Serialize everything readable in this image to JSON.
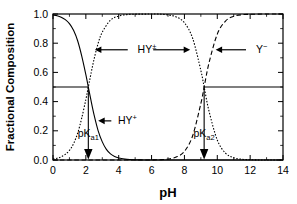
{
  "chart_data": {
    "type": "line",
    "title": "",
    "xlabel": "pH",
    "ylabel": "Fractional Composition",
    "xlim": [
      0,
      14
    ],
    "ylim": [
      0.0,
      1.0
    ],
    "xticks": [
      0,
      2,
      4,
      6,
      8,
      10,
      12,
      14
    ],
    "xtick_labels": [
      "0",
      "2",
      "4",
      "6",
      "8",
      "10",
      "12",
      "14"
    ],
    "xminorticks": [
      1,
      3,
      5,
      7,
      9,
      11,
      13
    ],
    "yticks": [
      0.0,
      0.2,
      0.4,
      0.6,
      0.8,
      1.0
    ],
    "ytick_labels": [
      "0.0",
      "0.2",
      "0.4",
      "0.6",
      "0.8",
      "1.0"
    ],
    "yminorticks": [
      0.1,
      0.3,
      0.5,
      0.7,
      0.9
    ],
    "grid": false,
    "legend": "none",
    "pKa1": 2.15,
    "pKa2": 9.2,
    "reference_line_y": 0.5,
    "series": [
      {
        "name": "HY+",
        "style": "solid",
        "x": [
          0.0,
          0.25,
          0.5,
          0.75,
          1.0,
          1.25,
          1.5,
          1.75,
          2.0,
          2.15,
          2.3,
          2.5,
          2.75,
          3.0,
          3.25,
          3.5,
          3.75,
          4.0,
          4.5,
          5.0,
          5.5,
          6.0,
          7.0,
          8.0,
          9.0,
          10.0,
          11.0,
          12.0,
          13.0,
          14.0
        ],
        "values": [
          0.993,
          0.988,
          0.978,
          0.961,
          0.934,
          0.888,
          0.817,
          0.712,
          0.585,
          0.5,
          0.415,
          0.309,
          0.2,
          0.124,
          0.073,
          0.042,
          0.024,
          0.014,
          0.004,
          0.001,
          0.0005,
          0.0002,
          0.0,
          0.0,
          0.0,
          0.0,
          0.0,
          0.0,
          0.0,
          0.0
        ]
      },
      {
        "name": "HY+-",
        "style": "dotted",
        "x": [
          0.0,
          0.25,
          0.5,
          0.75,
          1.0,
          1.25,
          1.5,
          1.75,
          2.0,
          2.15,
          2.3,
          2.5,
          2.75,
          3.0,
          3.5,
          4.0,
          4.5,
          5.0,
          5.5,
          6.0,
          6.5,
          7.0,
          7.5,
          8.0,
          8.5,
          9.0,
          9.2,
          9.5,
          10.0,
          10.5,
          11.0,
          11.5,
          12.0,
          12.5,
          13.0,
          13.5,
          14.0
        ],
        "values": [
          0.007,
          0.012,
          0.022,
          0.039,
          0.066,
          0.112,
          0.183,
          0.288,
          0.415,
          0.5,
          0.585,
          0.691,
          0.8,
          0.876,
          0.958,
          0.986,
          0.996,
          0.999,
          0.999,
          1.0,
          0.999,
          0.994,
          0.98,
          0.94,
          0.834,
          0.613,
          0.5,
          0.333,
          0.137,
          0.047,
          0.016,
          0.005,
          0.002,
          0.0005,
          0.0002,
          0.0001,
          0.0
        ]
      },
      {
        "name": "Y-",
        "style": "dashed",
        "x": [
          0.0,
          2.0,
          4.0,
          5.0,
          6.0,
          6.5,
          7.0,
          7.5,
          8.0,
          8.5,
          9.0,
          9.2,
          9.5,
          10.0,
          10.5,
          11.0,
          11.5,
          12.0,
          12.5,
          13.0,
          13.5,
          14.0
        ],
        "values": [
          0.0,
          0.0,
          0.0,
          0.0,
          0.0006,
          0.002,
          0.006,
          0.02,
          0.059,
          0.166,
          0.387,
          0.5,
          0.667,
          0.862,
          0.952,
          0.984,
          0.995,
          0.998,
          0.999,
          1.0,
          1.0,
          1.0
        ]
      }
    ],
    "annotations": [
      {
        "id": "hy-zwitterion",
        "text": "HY",
        "superscript": "±",
        "x": 5.15,
        "y": 0.755
      },
      {
        "id": "hy-cation",
        "text": "HY",
        "superscript": "+",
        "x": 3.95,
        "y": 0.268
      },
      {
        "id": "y-anion",
        "text": "Y",
        "superscript": "−",
        "x": 12.35,
        "y": 0.755
      },
      {
        "id": "pka1",
        "text": "pK",
        "subscript": "a1",
        "x": 1.5,
        "y": 0.185
      },
      {
        "id": "pka2",
        "text": "pK",
        "subscript": "a2",
        "x": 8.55,
        "y": 0.185
      }
    ]
  },
  "axes": {
    "x_title": "pH",
    "y_title": "Fractional Composition"
  }
}
